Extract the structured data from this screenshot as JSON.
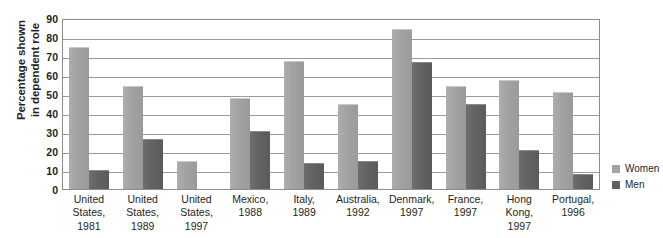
{
  "chart_data": {
    "type": "bar",
    "title": "",
    "subtitle": "",
    "xlabel": "",
    "ylabel": "Percentage shown\nin dependent role",
    "ylim": [
      0,
      90
    ],
    "ytick_step": 10,
    "yticks": [
      0,
      10,
      20,
      30,
      40,
      50,
      60,
      70,
      80,
      90
    ],
    "grid": true,
    "legend_position": "right",
    "categories": [
      "United\nStates,\n1981",
      "United\nStates,\n1989",
      "United\nStates,\n1997",
      "Mexico,\n1988",
      "Italy,\n1989",
      "Australia,\n1992",
      "Denmark,\n1997",
      "France,\n1997",
      "Hong\nKong,\n1997",
      "Portugal,\n1996"
    ],
    "series": [
      {
        "name": "Women",
        "color": "#a3a3a3",
        "values": [
          75,
          54,
          14.5,
          48,
          67.5,
          44.5,
          84,
          54,
          57.5,
          51
        ]
      },
      {
        "name": "Men",
        "color": "#5f5f5f",
        "values": [
          10,
          26.5,
          null,
          30.5,
          13.5,
          15,
          67,
          44.5,
          20.5,
          8
        ]
      }
    ]
  },
  "legend": {
    "items": [
      {
        "label": "Women",
        "color": "#a3a3a3"
      },
      {
        "label": "Men",
        "color": "#5f5f5f"
      }
    ]
  }
}
